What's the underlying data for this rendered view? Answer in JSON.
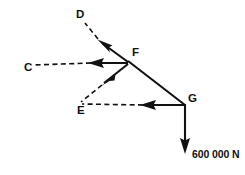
{
  "diagram": {
    "type": "force-polygon",
    "canvas": {
      "width": 245,
      "height": 175
    },
    "stroke_color": "#111111",
    "background_color": "#ffffff",
    "nodes": [
      {
        "id": "D",
        "label": "D",
        "label_x": 76,
        "label_y": 15,
        "point_x": 85,
        "point_y": 23
      },
      {
        "id": "C",
        "label": "C",
        "label_x": 24,
        "label_y": 68,
        "point_x": 33,
        "point_y": 65
      },
      {
        "id": "F",
        "label": "F",
        "label_x": 132,
        "label_y": 53,
        "point_x": 128,
        "point_y": 62
      },
      {
        "id": "E",
        "label": "E",
        "label_x": 77,
        "label_y": 111,
        "point_x": 81,
        "point_y": 102
      },
      {
        "id": "G",
        "label": "G",
        "label_x": 188,
        "label_y": 99,
        "point_x": 185,
        "point_y": 105
      }
    ],
    "members": [
      {
        "name": "member-FD",
        "from": "F",
        "to": "D",
        "solid": {
          "x1": 128,
          "y1": 62,
          "x2": 99,
          "y2": 41
        },
        "dashed": {
          "x1": 99,
          "y1": 41,
          "x2": 85,
          "y2": 23
        },
        "arrow_at": {
          "x": 99,
          "y": 41,
          "angle_deg": 216
        }
      },
      {
        "name": "member-FC",
        "from": "F",
        "to": "C",
        "solid": {
          "x1": 128,
          "y1": 63,
          "x2": 90,
          "y2": 63
        },
        "dashed": {
          "x1": 90,
          "y1": 63,
          "x2": 33,
          "y2": 65
        },
        "arrow_at": {
          "x": 90,
          "y": 63,
          "angle_deg": 180
        }
      },
      {
        "name": "member-FE",
        "from": "F",
        "to": "E",
        "solid": {
          "x1": 128,
          "y1": 64,
          "x2": 101,
          "y2": 85
        },
        "dashed": {
          "x1": 101,
          "y1": 85,
          "x2": 81,
          "y2": 102
        },
        "arrow_at": {
          "x": 101,
          "y": 85,
          "angle_deg": 142
        }
      },
      {
        "name": "member-FG",
        "from": "F",
        "to": "G",
        "solid": {
          "x1": 128,
          "y1": 62,
          "x2": 185,
          "y2": 105
        },
        "dashed": null,
        "arrow_at": null
      },
      {
        "name": "member-GE",
        "from": "G",
        "to": "E",
        "solid": {
          "x1": 185,
          "y1": 105,
          "x2": 142,
          "y2": 105
        },
        "dashed": {
          "x1": 142,
          "y1": 105,
          "x2": 82,
          "y2": 104
        },
        "arrow_at": {
          "x": 142,
          "y": 105,
          "angle_deg": 180
        }
      },
      {
        "name": "load-vector-G",
        "from": "G",
        "to": "load",
        "solid": {
          "x1": 185,
          "y1": 105,
          "x2": 185,
          "y2": 148
        },
        "dashed": null,
        "arrow_at": {
          "x": 185,
          "y": 153,
          "angle_deg": 90
        }
      }
    ],
    "load": {
      "name": "applied-load",
      "magnitude_text": "600 000 N",
      "value": 600000,
      "unit": "N",
      "label_x": 192,
      "label_y": 155,
      "direction": "down"
    }
  }
}
